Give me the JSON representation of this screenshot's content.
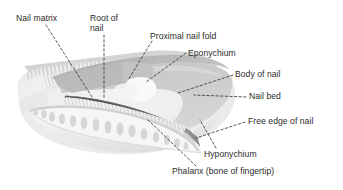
{
  "figure": {
    "background_color": "#ffffff",
    "text_color": "#2b2b2b",
    "leader_line_color": "#3a3a3a",
    "leader_line_style": "dashed",
    "width": 343,
    "height": 190
  },
  "palette": {
    "nail_plate": "#c9c9c9",
    "nail_plate_top": "#b4b4b4",
    "nail_bed_line": "#4a4a4a",
    "lunula": "#f2f2f2",
    "soft_tissue": "#ededed",
    "soft_tissue_shadow": "#dcdcdc",
    "bone_fill": "#f4f4f4",
    "bone_trabecula": "#d2d2d2",
    "skin_hatch": "#cfcfcf",
    "fingertip_pad": "#e4e4e4"
  },
  "labels": [
    {
      "id": "nail-matrix",
      "text": "Nail matrix",
      "x": 16,
      "y": 14,
      "align": "left",
      "lines": [
        "Nail matrix"
      ]
    },
    {
      "id": "root-of-nail",
      "text": "Root of nail",
      "x": 90,
      "y": 14,
      "align": "left",
      "lines": [
        "Root of",
        "nail"
      ]
    },
    {
      "id": "proximal-nail-fold",
      "text": "Proximal nail fold",
      "x": 150,
      "y": 32,
      "align": "left",
      "lines": [
        "Proximal nail fold"
      ]
    },
    {
      "id": "eponychium",
      "text": "Eponychium",
      "x": 188,
      "y": 49,
      "align": "left",
      "lines": [
        "Eponychium"
      ]
    },
    {
      "id": "body-of-nail",
      "text": "Body of nail",
      "x": 235,
      "y": 70,
      "align": "left",
      "lines": [
        "Body of nail"
      ]
    },
    {
      "id": "nail-bed",
      "text": "Nail bed",
      "x": 249,
      "y": 92,
      "align": "left",
      "lines": [
        "Nail bed"
      ]
    },
    {
      "id": "free-edge-of-nail",
      "text": "Free edge of nail",
      "x": 248,
      "y": 117,
      "align": "left",
      "lines": [
        "Free edge of nail"
      ]
    },
    {
      "id": "hyponychium",
      "text": "Hyponychium",
      "x": 204,
      "y": 150,
      "align": "left",
      "lines": [
        "Hyponychium"
      ]
    },
    {
      "id": "phalanx",
      "text": "Phalanx (bone of fingertip)",
      "x": 172,
      "y": 167,
      "align": "left",
      "lines": [
        "Phalanx (bone of fingertip)"
      ]
    }
  ],
  "structures": [
    {
      "id": "nail-plate",
      "name": "nail plate"
    },
    {
      "id": "proximal-nail-fold-flap",
      "name": "proximal nail fold"
    },
    {
      "id": "lunula",
      "name": "lunula"
    },
    {
      "id": "nail-bed-line",
      "name": "nail bed"
    },
    {
      "id": "phalanx-bone",
      "name": "distal phalanx"
    },
    {
      "id": "fingertip-pad",
      "name": "fingertip pad"
    },
    {
      "id": "skin-layers",
      "name": "skin and soft tissue"
    }
  ]
}
